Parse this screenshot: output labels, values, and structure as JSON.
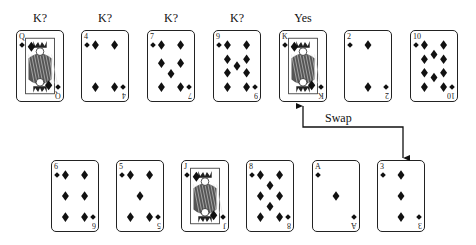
{
  "diagram": {
    "top_row": {
      "cards": [
        {
          "rank": "Q",
          "suit": "diamonds",
          "face": true,
          "label": "K?",
          "x": 16,
          "y": 30
        },
        {
          "rank": "4",
          "suit": "diamonds",
          "face": false,
          "label": "K?",
          "x": 81,
          "y": 30
        },
        {
          "rank": "7",
          "suit": "diamonds",
          "face": false,
          "label": "K?",
          "x": 147,
          "y": 30
        },
        {
          "rank": "9",
          "suit": "diamonds",
          "face": false,
          "label": "K?",
          "x": 213,
          "y": 30
        },
        {
          "rank": "K",
          "suit": "diamonds",
          "face": true,
          "label": "Yes",
          "x": 279,
          "y": 30
        },
        {
          "rank": "2",
          "suit": "diamonds",
          "face": false,
          "label": "",
          "x": 344,
          "y": 30
        },
        {
          "rank": "10",
          "suit": "diamonds",
          "face": false,
          "label": "",
          "x": 410,
          "y": 30
        }
      ]
    },
    "bottom_row": {
      "cards": [
        {
          "rank": "6",
          "suit": "diamonds",
          "face": false,
          "x": 51,
          "y": 160
        },
        {
          "rank": "5",
          "suit": "diamonds",
          "face": false,
          "x": 116,
          "y": 160
        },
        {
          "rank": "J",
          "suit": "diamonds",
          "face": true,
          "x": 181,
          "y": 160
        },
        {
          "rank": "8",
          "suit": "diamonds",
          "face": false,
          "x": 246,
          "y": 160
        },
        {
          "rank": "A",
          "suit": "diamonds",
          "face": false,
          "x": 312,
          "y": 160
        },
        {
          "rank": "3",
          "suit": "diamonds",
          "face": false,
          "x": 377,
          "y": 160
        }
      ]
    },
    "swap": {
      "label": "Swap",
      "from_card": "K (top row, position 5)",
      "to_card": "3 (bottom row, position 6)"
    },
    "colors": {
      "ink": "#111111",
      "background": "#ffffff"
    }
  }
}
